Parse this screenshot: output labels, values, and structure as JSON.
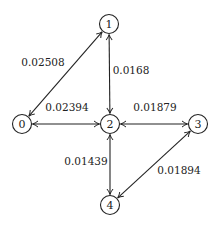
{
  "diagram": {
    "type": "weighted-graph",
    "directed": "bidirectional",
    "colors": {
      "stroke": "#222222",
      "text": "#222222",
      "background": "#ffffff"
    },
    "nodes": [
      {
        "id": "0",
        "label": "0",
        "x": 22,
        "y": 124
      },
      {
        "id": "1",
        "label": "1",
        "x": 109,
        "y": 24
      },
      {
        "id": "2",
        "label": "2",
        "x": 110,
        "y": 124
      },
      {
        "id": "3",
        "label": "3",
        "x": 198,
        "y": 124
      },
      {
        "id": "4",
        "label": "4",
        "x": 110,
        "y": 205
      }
    ],
    "edges": [
      {
        "from": "0",
        "to": "1",
        "weight": "0.02508",
        "label_x": 43,
        "label_y": 66
      },
      {
        "from": "1",
        "to": "2",
        "weight": "0.0168",
        "label_x": 131,
        "label_y": 74
      },
      {
        "from": "0",
        "to": "2",
        "weight": "0.02394",
        "label_x": 67,
        "label_y": 111
      },
      {
        "from": "2",
        "to": "3",
        "weight": "0.01879",
        "label_x": 155,
        "label_y": 111
      },
      {
        "from": "2",
        "to": "4",
        "weight": "0.01439",
        "label_x": 86,
        "label_y": 165
      },
      {
        "from": "3",
        "to": "4",
        "weight": "0.01894",
        "label_x": 179,
        "label_y": 174
      }
    ]
  }
}
